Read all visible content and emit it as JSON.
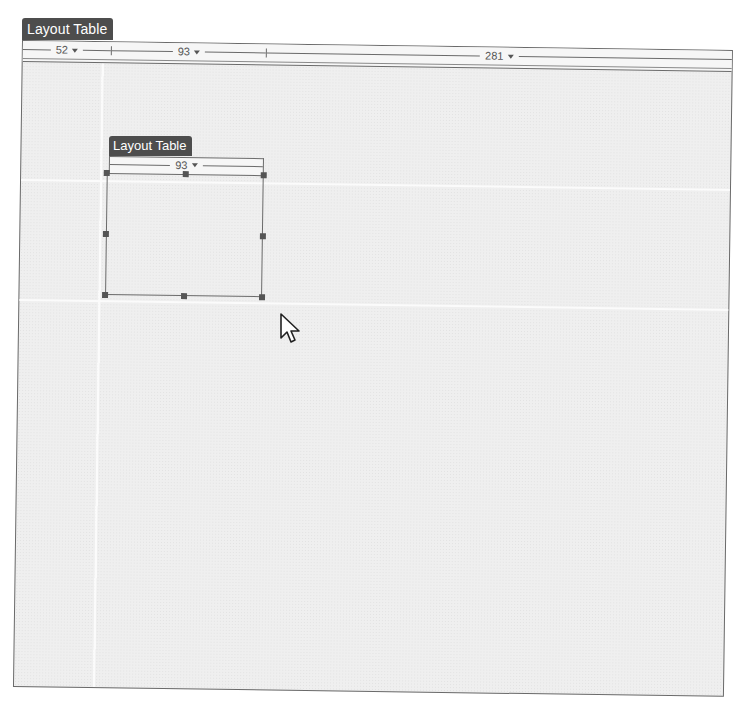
{
  "canvas": {
    "background": "#efefef",
    "grid_color": "#fbfbfb",
    "border_color": "#6a6a6a",
    "tab_color": "#4d4d4d"
  },
  "outer_table": {
    "tab_label": "Layout Table",
    "columns": [
      {
        "width_label": "52",
        "menu_icon": "dropdown-arrow-icon"
      },
      {
        "width_label": "93",
        "menu_icon": "dropdown-arrow-icon"
      },
      {
        "width_label": "281",
        "menu_icon": "dropdown-arrow-icon"
      }
    ]
  },
  "inner_table": {
    "tab_label": "Layout Table",
    "columns": [
      {
        "width_label": "93",
        "menu_icon": "dropdown-arrow-icon"
      }
    ],
    "selected": true,
    "resize_handles": [
      "top-left",
      "top-center",
      "top-right",
      "middle-left",
      "middle-right",
      "bottom-left",
      "bottom-center",
      "bottom-right"
    ]
  },
  "cursor": {
    "type": "arrow-pointer-icon"
  }
}
